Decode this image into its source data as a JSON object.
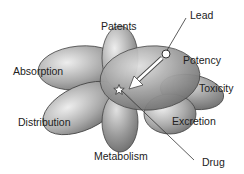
{
  "diagram": {
    "labels": {
      "patents": "Patents",
      "lead": "Lead",
      "potency": "Potency",
      "toxicity": "Toxicity",
      "absorption": "Absorption",
      "distribution": "Distribution",
      "excretion": "Excretion",
      "metabolism": "Metabolism",
      "drug": "Drug"
    },
    "petals": [
      "Patents",
      "Potency",
      "Toxicity",
      "Excretion",
      "Metabolism",
      "Distribution",
      "Absorption"
    ],
    "markers": {
      "lead": "circle",
      "drug": "star",
      "arrow": "lead-to-drug"
    },
    "colors": {
      "petal_light": "#e8e8e8",
      "petal_dark": "#7a7a7a",
      "outline": "#444444",
      "text": "#222222"
    }
  }
}
